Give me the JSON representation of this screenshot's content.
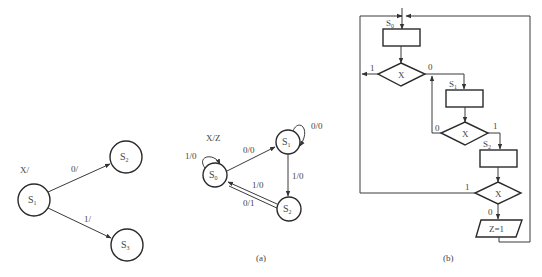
{
  "left_diagram": {
    "header_label": "X/",
    "states": [
      {
        "name": "S",
        "sub": "1"
      },
      {
        "name": "S",
        "sub": "2"
      },
      {
        "name": "S",
        "sub": "3"
      }
    ],
    "transitions": [
      {
        "from": "S1",
        "to": "S2",
        "label": "0/"
      },
      {
        "from": "S1",
        "to": "S3",
        "label": "1/"
      }
    ]
  },
  "diagram_a": {
    "header_label": "X/Z",
    "caption": "(a)",
    "states": [
      {
        "name": "S",
        "sub": "0"
      },
      {
        "name": "S",
        "sub": "1"
      },
      {
        "name": "S",
        "sub": "2"
      }
    ],
    "transitions": [
      {
        "from": "S0",
        "to": "S0",
        "label": "1/0"
      },
      {
        "from": "S0",
        "to": "S1",
        "label": "0/0"
      },
      {
        "from": "S1",
        "to": "S1",
        "label": "0/0"
      },
      {
        "from": "S1",
        "to": "S2",
        "label": "1/0"
      },
      {
        "from": "S2",
        "to": "S0",
        "label": "1/0"
      },
      {
        "from": "S2",
        "to": "S0",
        "label": "0/1"
      }
    ]
  },
  "diagram_b": {
    "caption": "(b)",
    "state_boxes": [
      {
        "name": "S",
        "sub": "0"
      },
      {
        "name": "S",
        "sub": "1"
      },
      {
        "name": "S",
        "sub": "2"
      }
    ],
    "decisions": [
      {
        "label": "X",
        "left_branch": "1",
        "right_branch": "0"
      },
      {
        "label": "X",
        "left_branch": "0",
        "right_branch": "1"
      },
      {
        "label": "X",
        "left_branch": "1",
        "bottom_branch": "0"
      }
    ],
    "output_box": "Z=1"
  }
}
